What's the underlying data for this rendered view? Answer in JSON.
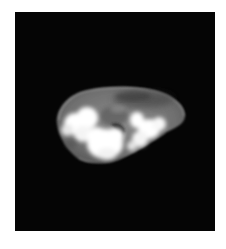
{
  "image": {
    "kind": "ct-scan-cross-section",
    "background_color": "#ffffff",
    "frame_color": "#050505",
    "soft_tissue_color": "#7a7a7a",
    "bright_structure_color": "#ffffff"
  }
}
